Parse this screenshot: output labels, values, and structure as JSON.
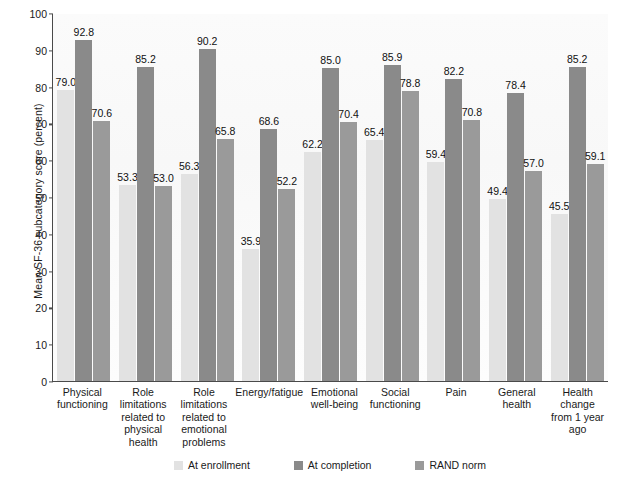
{
  "chart_data": {
    "type": "bar",
    "title": "",
    "xlabel": "",
    "ylabel": "Mean SF-36 subcategory score (percent)",
    "ylim": [
      0,
      100
    ],
    "ytick_step": 10,
    "yticks": [
      100,
      90,
      80,
      70,
      60,
      50,
      40,
      30,
      20,
      10,
      0
    ],
    "grid": false,
    "legend_position": "bottom-center",
    "categories": [
      "Physical functioning",
      "Role limitations related to physical health",
      "Role limitations related to emotional problems",
      "Energy/fatigue",
      "Emotional well-being",
      "Social functioning",
      "Pain",
      "General health",
      "Health change from 1 year ago"
    ],
    "category_label_lines": [
      [
        "Physical",
        "functioning"
      ],
      [
        "Role",
        "limitations",
        "related to",
        "physical",
        "health"
      ],
      [
        "Role",
        "limitations",
        "related to",
        "emotional",
        "problems"
      ],
      [
        "Energy/fatigue"
      ],
      [
        "Emotional",
        "well-being"
      ],
      [
        "Social",
        "functioning"
      ],
      [
        "Pain"
      ],
      [
        "General",
        "health"
      ],
      [
        "Health change",
        "from 1 year",
        "ago"
      ]
    ],
    "series": [
      {
        "name": "At enrollment",
        "color": "#e2e2e2",
        "values": [
          79.0,
          53.3,
          56.3,
          35.9,
          62.2,
          65.4,
          59.4,
          49.4,
          45.5
        ],
        "labels": [
          "79.0",
          "53.3",
          "56.3",
          "35.9",
          "62.2",
          "65.4",
          "59.4",
          "49.4",
          "45.5"
        ]
      },
      {
        "name": "At completion",
        "color": "#8a8a8a",
        "values": [
          92.8,
          85.2,
          90.2,
          68.6,
          85.0,
          85.9,
          82.2,
          78.4,
          85.2
        ],
        "labels": [
          "92.8",
          "85.2",
          "90.2",
          "68.6",
          "85.0",
          "85.9",
          "82.2",
          "78.4",
          "85.2"
        ]
      },
      {
        "name": "RAND norm",
        "color": "#9a9a9a",
        "values": [
          70.6,
          53.0,
          65.8,
          52.2,
          70.4,
          78.8,
          70.8,
          57.0,
          59.1
        ],
        "labels": [
          "70.6",
          "53.0",
          "65.8",
          "52.2",
          "70.4",
          "78.8",
          "70.8",
          "57.0",
          "59.1"
        ]
      }
    ]
  }
}
